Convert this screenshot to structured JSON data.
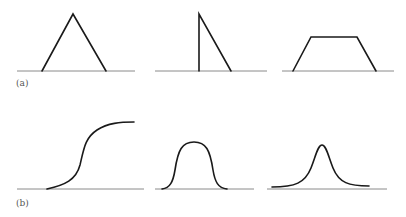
{
  "figure": {
    "panels": [
      {
        "label": "(a)",
        "label_pos": {
          "x": 16,
          "y": 79
        },
        "description": "Piecewise-linear membership functions",
        "shapes": [
          {
            "name": "triangular",
            "baseline": {
              "x1": 17,
              "x2": 135,
              "y": 71
            },
            "path": "M 42 71 L 73 14 L 106 71"
          },
          {
            "name": "right-triangular",
            "baseline": {
              "x1": 155,
              "x2": 267,
              "y": 71
            },
            "path": "M 199 71 L 199 14 L 231 71"
          },
          {
            "name": "trapezoidal",
            "baseline": {
              "x1": 282,
              "x2": 394,
              "y": 71
            },
            "path": "M 293 71 L 311 37 L 357 37 L 376 71"
          }
        ]
      },
      {
        "label": "(b)",
        "label_pos": {
          "x": 16,
          "y": 199
        },
        "description": "Smooth membership functions",
        "shapes": [
          {
            "name": "sigmoidal",
            "baseline": {
              "x1": 17,
              "x2": 144,
              "y": 189
            },
            "path": "M 47 189 C 65 185, 76 180, 80 165 C 84 148, 85 138, 97 130 C 108 123, 120 122, 134 122"
          },
          {
            "name": "bell-shaped",
            "baseline": {
              "x1": 155,
              "x2": 254,
              "y": 189
            },
            "path": "M 162 189 C 170 188, 173 182, 175 170 C 178 150, 182 142, 194 142 C 206 142, 210 150, 213 170 C 215 182, 218 188, 227 189"
          },
          {
            "name": "peaked",
            "baseline": {
              "x1": 267,
              "x2": 387,
              "y": 189
            },
            "path": "M 272 187 C 295 187, 305 183, 311 168 C 316 155, 318 145, 322 145 C 326 145, 328 155, 333 168 C 339 183, 349 186, 369 186"
          }
        ]
      }
    ]
  }
}
